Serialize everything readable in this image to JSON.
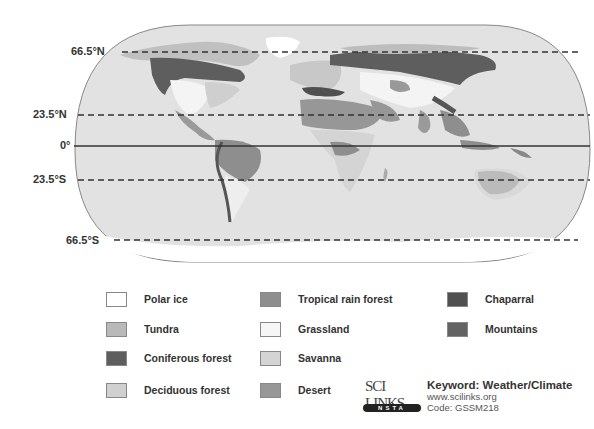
{
  "map": {
    "title": "World Biomes",
    "latitude_lines": [
      {
        "label": "66.5°N",
        "style": "dashed",
        "y": 52
      },
      {
        "label": "23.5°N",
        "style": "dashed",
        "y": 115
      },
      {
        "label": "0°",
        "style": "solid",
        "y": 146
      },
      {
        "label": "23.5°S",
        "style": "dashed",
        "y": 180
      },
      {
        "label": "66.5°S",
        "style": "dashed",
        "y": 240
      }
    ]
  },
  "legend": {
    "items": [
      {
        "label": "Polar ice",
        "color": "#ffffff"
      },
      {
        "label": "Tundra",
        "color": "#b9b9b9"
      },
      {
        "label": "Coniferous forest",
        "color": "#5e5e5e"
      },
      {
        "label": "Deciduous forest",
        "color": "#d0d0d0"
      },
      {
        "label": "Tropical rain forest",
        "color": "#8e8e8e"
      },
      {
        "label": "Grassland",
        "color": "#f6f6f6"
      },
      {
        "label": "Savanna",
        "color": "#d4d4d4"
      },
      {
        "label": "Desert",
        "color": "#979797"
      },
      {
        "label": "Chaparral",
        "color": "#505050"
      },
      {
        "label": "Mountains",
        "color": "#636363"
      }
    ]
  },
  "scilinks": {
    "logo_top": "SCI LINKS",
    "logo_bar": "NSTA",
    "keyword": "Keyword: Weather/Climate",
    "url": "www.scilinks.org",
    "code": "Code: GSSM218"
  }
}
